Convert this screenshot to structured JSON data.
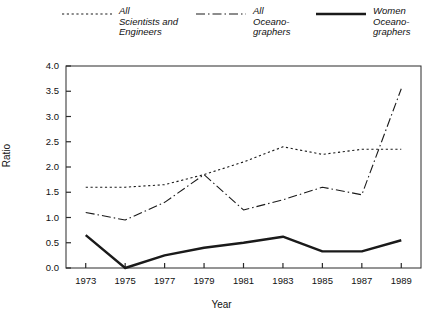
{
  "chart_data": {
    "type": "line",
    "title": "",
    "xlabel": "Year",
    "ylabel": "Ratio",
    "x": [
      1973,
      1975,
      1977,
      1979,
      1981,
      1983,
      1985,
      1987,
      1989
    ],
    "xtick_labels": [
      "1973",
      "1975",
      "1977",
      "1979",
      "1981",
      "1983",
      "1985",
      "1987",
      "1989"
    ],
    "ytick_labels": [
      "0.0",
      "0.5",
      "1.0",
      "1.5",
      "2.0",
      "2.5",
      "3.0",
      "3.5",
      "4.0"
    ],
    "ylim": [
      0.0,
      4.0
    ],
    "ytick_step": 0.5,
    "xlim": [
      1972,
      1990
    ],
    "grid": false,
    "legend_position": "above-plot",
    "series": [
      {
        "name": "All\nScientists and\nEngineers",
        "style": "dotted",
        "color": "#1a1a1a",
        "values": [
          1.6,
          1.6,
          1.65,
          1.85,
          2.1,
          2.4,
          2.25,
          2.35,
          2.35
        ]
      },
      {
        "name": "All\nOceano-\ngraphers",
        "style": "dash-dot",
        "color": "#1a1a1a",
        "values": [
          1.1,
          0.95,
          1.3,
          1.85,
          1.15,
          1.35,
          1.6,
          1.45,
          3.55
        ]
      },
      {
        "name": "Women\nOceano-\ngraphers",
        "style": "solid",
        "color": "#1a1a1a",
        "values": [
          0.65,
          0.0,
          0.25,
          0.4,
          0.5,
          0.62,
          0.33,
          0.33,
          0.55
        ]
      }
    ]
  },
  "legend": {
    "entries": [
      {
        "label": "All\nScientists and\nEngineers",
        "style": "dotted"
      },
      {
        "label": "All\nOceano-\ngraphers",
        "style": "dash-dot"
      },
      {
        "label": "Women\nOceano-\ngraphers",
        "style": "solid"
      }
    ]
  },
  "axes": {
    "x_title": "Year",
    "y_title": "Ratio"
  }
}
